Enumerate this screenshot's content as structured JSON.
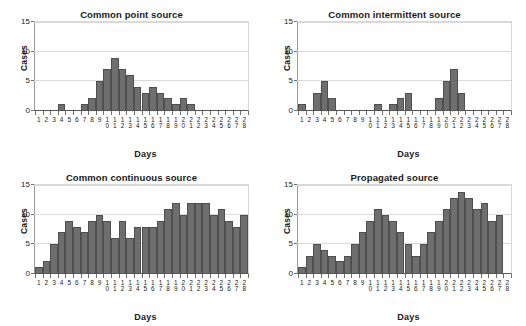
{
  "figure": {
    "panels": [
      {
        "key": "common_point_source",
        "title": "Common point source",
        "xlabel": "Days",
        "ylabel": "Cases"
      },
      {
        "key": "common_intermittent_source",
        "title": "Common intermittent source",
        "xlabel": "Days",
        "ylabel": "Cases"
      },
      {
        "key": "common_continuous_source",
        "title": "Common continuous source",
        "xlabel": "Days",
        "ylabel": "Cases"
      },
      {
        "key": "propagated_source",
        "title": "Propagated source",
        "xlabel": "Days",
        "ylabel": "Cases"
      }
    ],
    "colors": {
      "bar_fill": "#6e6e6e",
      "bar_edge": "#4f4f4f",
      "gridline": "#d9d9d9",
      "axis": "#555555",
      "text": "#1a1a1a",
      "background": "#ffffff"
    }
  },
  "chart_data": [
    {
      "type": "bar",
      "title": "Common point source",
      "xlabel": "Days",
      "ylabel": "Cases",
      "ylim": [
        0,
        15
      ],
      "yticks": [
        0,
        5,
        10,
        15
      ],
      "grid": true,
      "legend": null,
      "categories": [
        1,
        2,
        3,
        4,
        5,
        6,
        7,
        8,
        9,
        10,
        11,
        12,
        13,
        14,
        15,
        16,
        17,
        18,
        19,
        20,
        21,
        22,
        23,
        24,
        25,
        26,
        27,
        28
      ],
      "values": [
        0,
        0,
        0,
        1,
        0,
        0,
        1,
        2,
        5,
        7,
        9,
        7,
        6,
        4,
        3,
        4,
        3,
        2,
        1,
        2,
        1,
        0,
        0,
        0,
        0,
        0,
        0,
        0
      ]
    },
    {
      "type": "bar",
      "title": "Common intermittent source",
      "xlabel": "Days",
      "ylabel": "Cases",
      "ylim": [
        0,
        15
      ],
      "yticks": [
        0,
        5,
        10,
        15
      ],
      "grid": true,
      "legend": null,
      "categories": [
        1,
        2,
        3,
        4,
        5,
        6,
        7,
        8,
        9,
        10,
        11,
        12,
        13,
        14,
        15,
        16,
        17,
        18,
        19,
        20,
        21,
        22,
        23,
        24,
        25,
        26,
        27,
        28
      ],
      "values": [
        1,
        0,
        3,
        5,
        2,
        0,
        0,
        0,
        0,
        0,
        1,
        0,
        1,
        2,
        3,
        0,
        0,
        0,
        2,
        5,
        7,
        3,
        0,
        0,
        0,
        0,
        0,
        0
      ]
    },
    {
      "type": "bar",
      "title": "Common continuous source",
      "xlabel": "Days",
      "ylabel": "Cases",
      "ylim": [
        0,
        15
      ],
      "yticks": [
        0,
        5,
        10,
        15
      ],
      "grid": true,
      "legend": null,
      "categories": [
        1,
        2,
        3,
        4,
        5,
        6,
        7,
        8,
        9,
        10,
        11,
        12,
        13,
        14,
        15,
        16,
        17,
        18,
        19,
        20,
        21,
        22,
        23,
        24,
        25,
        26,
        27,
        28
      ],
      "values": [
        1,
        2,
        5,
        7,
        9,
        8,
        7,
        9,
        10,
        9,
        6,
        9,
        6,
        8,
        8,
        8,
        9,
        11,
        12,
        10,
        12,
        12,
        12,
        10,
        11,
        9,
        8,
        10
      ]
    },
    {
      "type": "bar",
      "title": "Propagated source",
      "xlabel": "Days",
      "ylabel": "Cases",
      "ylim": [
        0,
        15
      ],
      "yticks": [
        0,
        5,
        10,
        15
      ],
      "grid": true,
      "legend": null,
      "categories": [
        1,
        2,
        3,
        4,
        5,
        6,
        7,
        8,
        9,
        10,
        11,
        12,
        13,
        14,
        15,
        16,
        17,
        18,
        19,
        20,
        21,
        22,
        23,
        24,
        25,
        26,
        27,
        28
      ],
      "values": [
        1,
        3,
        5,
        4,
        3,
        2,
        3,
        5,
        7,
        9,
        11,
        10,
        9,
        7,
        5,
        3,
        5,
        7,
        9,
        11,
        13,
        14,
        13,
        11,
        12,
        9,
        10,
        0
      ]
    }
  ]
}
